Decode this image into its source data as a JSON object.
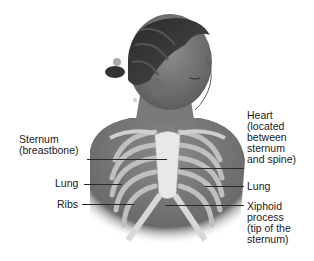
{
  "figure": {
    "labels_left": [
      {
        "id": "sternum",
        "text": "Sternum\n(breastbone)"
      },
      {
        "id": "lung-left",
        "text": "Lung"
      },
      {
        "id": "ribs",
        "text": "Ribs"
      }
    ],
    "labels_right": [
      {
        "id": "heart",
        "text": "Heart\n(located\nbetween\nsternum\nand spine)"
      },
      {
        "id": "lung-right",
        "text": "Lung"
      },
      {
        "id": "xiphoid",
        "text": "Xiphoid\nprocess\n(tip of the\nsternum)"
      }
    ]
  }
}
